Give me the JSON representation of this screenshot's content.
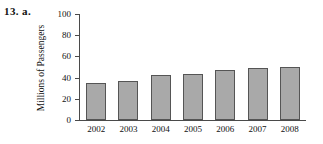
{
  "problem": {
    "label": "13. a."
  },
  "chart_data": {
    "type": "bar",
    "title": "",
    "xlabel": "",
    "ylabel": "Millions of Passengers",
    "categories": [
      "2002",
      "2003",
      "2004",
      "2005",
      "2006",
      "2007",
      "2008"
    ],
    "values": [
      35,
      37,
      42,
      43,
      47,
      49,
      50
    ],
    "ylim": [
      0,
      100
    ],
    "yticks": [
      0,
      20,
      40,
      60,
      80,
      100
    ],
    "ytick_labels": [
      "0",
      "20",
      "40",
      "60",
      "80",
      "100"
    ],
    "grid": false,
    "legend": null,
    "bar_color": "#a9a9a9",
    "bar_border_color": "#555555",
    "axis_color": "#4a4a4a",
    "text_color": "#111111"
  }
}
